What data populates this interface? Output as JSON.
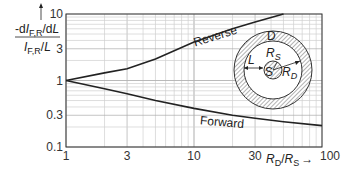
{
  "chart_data": {
    "type": "line",
    "title": "",
    "xlabel": "R_D/R_S",
    "ylabel": "-dI_F,R/dL / (I_F,R/L)",
    "xscale": "log",
    "yscale": "log",
    "xlim": [
      1,
      100
    ],
    "ylim": [
      0.1,
      10
    ],
    "x_ticks": [
      "1",
      "3",
      "10",
      "30",
      "100"
    ],
    "y_ticks": [
      "0.1",
      "0.3",
      "1",
      "3",
      "10"
    ],
    "grid": true,
    "series": [
      {
        "name": "Reverse",
        "x": [
          1,
          2,
          3,
          5,
          10,
          20,
          30,
          50
        ],
        "y": [
          1,
          1.3,
          1.5,
          2.1,
          3.8,
          6.0,
          7.6,
          10
        ]
      },
      {
        "name": "Forward",
        "x": [
          1,
          2,
          3,
          5,
          10,
          20,
          30,
          50,
          100
        ],
        "y": [
          1,
          0.75,
          0.63,
          0.5,
          0.38,
          0.3,
          0.27,
          0.24,
          0.21
        ]
      }
    ],
    "annotations": [
      "Reverse",
      "Forward"
    ],
    "inset": {
      "labels": [
        "D",
        "R_S",
        "S",
        "L",
        "R_D"
      ]
    }
  },
  "labels": {
    "ylabel_num_prefix": "-d",
    "ylabel_num_I": "I",
    "ylabel_num_sub": "F,R",
    "ylabel_num_suffix": "/d",
    "ylabel_num_L": "L",
    "ylabel_den_I": "I",
    "ylabel_den_sub": "F,R",
    "ylabel_den_suffix": "/",
    "ylabel_den_L": "L",
    "xlabel_R1": "R",
    "xlabel_sub1": "D",
    "xlabel_sep": "/",
    "xlabel_R2": "R",
    "xlabel_sub2": "S",
    "xlabel_arrow": "→",
    "reverse": "Reverse",
    "forward": "Forward",
    "inset_D": "D",
    "inset_RS": "R",
    "inset_RS_sub": "S",
    "inset_S": "S",
    "inset_L": "L",
    "inset_RD": "R",
    "inset_RD_sub": "D"
  }
}
